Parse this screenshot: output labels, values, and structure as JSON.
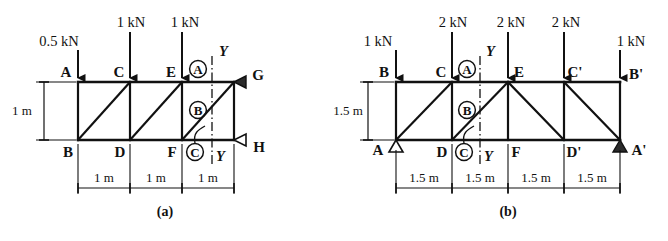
{
  "figure": {
    "caption_a": "(a)",
    "caption_b": "(b)",
    "section_label": "Y"
  },
  "truss_a": {
    "height_dim": "1 m",
    "panel_dims": [
      "1 m",
      "1 m",
      "1 m"
    ],
    "top_nodes": [
      "A",
      "C",
      "E",
      "G"
    ],
    "bottom_nodes": [
      "B",
      "D",
      "F",
      "H"
    ],
    "loads": [
      {
        "node": "A",
        "label": "0.5 kN"
      },
      {
        "node": "C",
        "label": "1 kN"
      },
      {
        "node": "E",
        "label": "1 kN"
      }
    ],
    "members_marked": [
      "A",
      "B",
      "C"
    ],
    "supports": [
      {
        "node": "G",
        "type": "pin-left"
      },
      {
        "node": "H",
        "type": "roller-left"
      }
    ]
  },
  "truss_b": {
    "height_dim": "1.5 m",
    "panel_dims": [
      "1.5 m",
      "1.5 m",
      "1.5 m",
      "1.5 m"
    ],
    "top_nodes": [
      "B",
      "C",
      "E",
      "C'",
      "B'"
    ],
    "bottom_nodes": [
      "A",
      "D",
      "F",
      "D'",
      "A'"
    ],
    "loads": [
      {
        "node": "B",
        "label": "1 kN"
      },
      {
        "node": "C",
        "label": "2 kN"
      },
      {
        "node": "E",
        "label": "2 kN"
      },
      {
        "node": "C'",
        "label": "2 kN"
      },
      {
        "node": "B'",
        "label": "1 kN"
      }
    ],
    "members_marked": [
      "A",
      "B",
      "C"
    ],
    "supports": [
      {
        "node": "A",
        "type": "pin-up"
      },
      {
        "node": "A'",
        "type": "roller-up"
      }
    ]
  }
}
